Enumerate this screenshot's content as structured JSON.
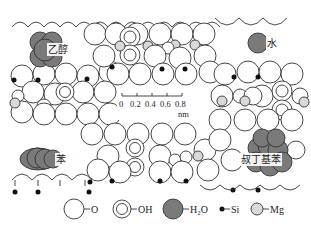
{
  "figure": {
    "type": "sepiolite-channel-adsorption-diagram",
    "colors": {
      "oxygen": "#ffffff",
      "hydroxyl": "#ffffff",
      "water": "#7a7a7a",
      "silicon": "#111111",
      "magnesium": "#d9d9d9",
      "stroke": "#333333"
    }
  },
  "molecules": [
    {
      "label": "乙醇",
      "name": "ethanol",
      "x": 40,
      "y": 51
    },
    {
      "label": "水",
      "name": "water",
      "x": 262,
      "y": 43
    },
    {
      "label": "苯",
      "name": "benzene",
      "x": 44,
      "y": 159
    },
    {
      "label": "叔丁基苯",
      "name": "tert-butylbenzene",
      "x": 262,
      "y": 160
    }
  ],
  "scale_bar": {
    "ticks": [
      "0",
      "0.2",
      "0.4",
      "0.6",
      "0.8"
    ],
    "unit": "nm"
  },
  "legend": {
    "items": [
      {
        "symbol": "open-circle",
        "label": "O"
      },
      {
        "symbol": "double-circle",
        "label": "OH"
      },
      {
        "symbol": "dark-circle",
        "label": "H₂O"
      },
      {
        "symbol": "small-black-dot",
        "label": "Si"
      },
      {
        "symbol": "light-grey-circle",
        "label": "Mg"
      }
    ]
  }
}
